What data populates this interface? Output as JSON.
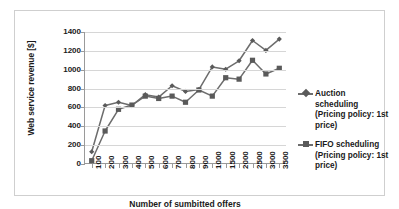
{
  "chart_data": {
    "type": "line",
    "title": "",
    "xlabel": "Number of sumbitted offers",
    "ylabel": "Web service revenue [$]",
    "categories": [
      "100",
      "200",
      "300",
      "400",
      "500",
      "600",
      "700",
      "800",
      "900",
      "1000",
      "1500",
      "2000",
      "2500",
      "3000",
      "3500"
    ],
    "ylim": [
      0,
      1400
    ],
    "ytick_values": [
      0,
      200,
      400,
      600,
      800,
      1000,
      1200,
      1400
    ],
    "ytick_labels": [
      "0",
      "200",
      "400",
      "600",
      "800",
      "1000",
      "1200",
      "1400"
    ],
    "grid": true,
    "legend_position": "right",
    "series": [
      {
        "name": "Auction scheduling (Pricing policy: 1st price)",
        "marker": "diamond",
        "color": "#6d6d6d",
        "values": [
          130,
          620,
          655,
          620,
          735,
          710,
          830,
          770,
          790,
          1030,
          1005,
          1095,
          1310,
          1205,
          1325
        ]
      },
      {
        "name": "FIFO scheduling (Pricing policy: 1st price)",
        "marker": "square",
        "color": "#6d6d6d",
        "values": [
          35,
          350,
          580,
          625,
          720,
          695,
          720,
          655,
          785,
          720,
          915,
          900,
          1100,
          955,
          1015
        ]
      }
    ]
  },
  "legend": {
    "entries": [
      {
        "line1": "Auction",
        "line2": "scheduling",
        "line3": "(Pricing policy: 1st",
        "line4": "price)"
      },
      {
        "line1": "FIFO scheduling",
        "line2": "(Pricing policy: 1st",
        "line3": "price)"
      }
    ]
  },
  "colors": {
    "series_line": "#6d6d6d",
    "marker": "#5a5a5a",
    "gridline": "#d6d6d6",
    "axis": "#9a9a9a",
    "frame": "#cfcfcf",
    "text": "#1a1a1a",
    "background": "#ffffff"
  }
}
